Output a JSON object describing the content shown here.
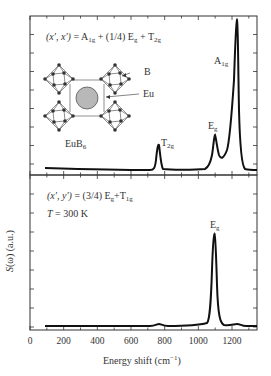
{
  "chart_data": [
    {
      "type": "line",
      "panel": "top",
      "title": "(x′, x′) = A1g + (1/4) Eg + T2g",
      "xlabel": "Energy shift (cm−1)",
      "ylabel": "S(ω) (a.u.)",
      "xlim": [
        0,
        1350
      ],
      "x_ticks": [
        0,
        200,
        400,
        600,
        800,
        1000,
        1200
      ],
      "grid": false,
      "inset": {
        "label": "EuB6",
        "annotations": [
          "B",
          "Eu"
        ]
      },
      "peaks": [
        {
          "label": "T2g",
          "x": 762,
          "relative_height": 0.28
        },
        {
          "label": "Eg",
          "x": 1095,
          "relative_height": 0.32
        },
        {
          "label": "A1g",
          "x": 1232,
          "relative_height": 1.0
        }
      ],
      "series": [
        {
          "name": "(x′, x′)",
          "x": [
            100,
            300,
            500,
            700,
            740,
            762,
            785,
            900,
            1050,
            1080,
            1095,
            1115,
            1140,
            1180,
            1210,
            1232,
            1250,
            1300,
            1350
          ],
          "y": [
            0.04,
            0.03,
            0.02,
            0.02,
            0.03,
            0.28,
            0.03,
            0.02,
            0.05,
            0.22,
            0.32,
            0.18,
            0.15,
            0.22,
            0.45,
            1.0,
            0.2,
            0.03,
            0.02
          ]
        }
      ]
    },
    {
      "type": "line",
      "panel": "bottom",
      "title": "(x′, y′) = (3/4) Eg + T1g",
      "annotation": "T = 300 K",
      "xlabel": "Energy shift (cm−1)",
      "ylabel": "S(ω) (a.u.)",
      "xlim": [
        0,
        1350
      ],
      "x_ticks": [
        0,
        200,
        400,
        600,
        800,
        1000,
        1200
      ],
      "grid": false,
      "peaks": [
        {
          "label": "Eg",
          "x": 1095,
          "relative_height": 1.0
        }
      ],
      "series": [
        {
          "name": "(x′, y′)",
          "x": [
            100,
            300,
            500,
            700,
            762,
            800,
            1000,
            1060,
            1080,
            1095,
            1110,
            1130,
            1200,
            1235,
            1270,
            1350
          ],
          "y": [
            0.02,
            0.01,
            0.01,
            0.01,
            0.025,
            0.01,
            0.02,
            0.08,
            0.5,
            1.0,
            0.5,
            0.06,
            0.02,
            0.04,
            0.015,
            0.01
          ]
        }
      ]
    }
  ],
  "labels": {
    "top_formula": "(x′, x′) = A",
    "top_formula_sub1": "1g",
    "top_formula_mid": " + (1/4) E",
    "top_formula_sub2": "g",
    "top_formula_mid2": " + T",
    "top_formula_sub3": "2g",
    "bottom_formula_a": "(x′, y′) = (3/4) E",
    "bottom_formula_sub1": "g",
    "bottom_formula_b": "+T",
    "bottom_formula_sub2": "1g",
    "temp_T": "T",
    "temp_rest": " = 300 K",
    "peak_T": "T",
    "peak_T_sub": "2g",
    "peak_E": "E",
    "peak_E_sub": "g",
    "peak_A": "A",
    "peak_A_sub": "1g",
    "peak_E2": "E",
    "peak_E2_sub": "g",
    "inset_B": "B",
    "inset_Eu": "Eu",
    "inset_name": "EuB",
    "inset_name_sub": "6",
    "ylabel": "S(ω) (a.u.)",
    "xlabel": "Energy shift (cm",
    "xlabel_sup": "−1",
    "xlabel_end": ")",
    "ticks": [
      "0",
      "200",
      "400",
      "600",
      "800",
      "1000",
      "1200"
    ]
  }
}
